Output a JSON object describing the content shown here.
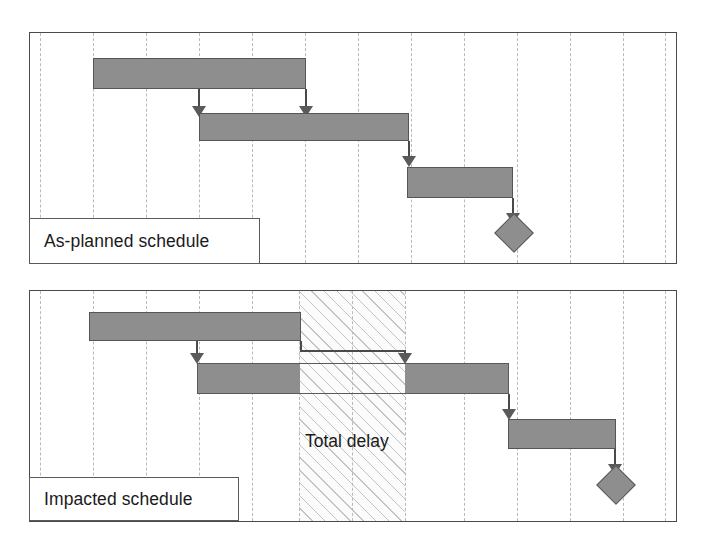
{
  "diagram": {
    "type": "gantt-delay-comparison",
    "colors": {
      "bar_fill": "#8e8e8e",
      "bar_border": "#555555",
      "gridline": "#b9b9b9",
      "frame": "#4a4a4a",
      "hatch": "#969696",
      "background": "#ffffff"
    }
  },
  "panels": [
    {
      "id": "as-planned",
      "legend_label": "As-planned schedule",
      "gridline_count": 13,
      "tasks": [
        {
          "name": "task-1",
          "start": 92,
          "end": 305,
          "row": 0
        },
        {
          "name": "task-2",
          "start": 198,
          "end": 408,
          "row": 1
        },
        {
          "name": "task-3",
          "start": 406,
          "end": 512,
          "row": 2
        }
      ],
      "milestone": {
        "name": "completion-milestone",
        "x": 512
      },
      "links": [
        {
          "from": "task-1",
          "to": "task-2",
          "at": 198
        },
        {
          "from": "task-1",
          "to": "task-2",
          "at": 305
        },
        {
          "from": "task-2",
          "to": "task-3",
          "at": 408
        },
        {
          "from": "task-3",
          "to": "milestone",
          "at": 512
        }
      ]
    },
    {
      "id": "impacted",
      "legend_label": "Impacted schedule",
      "delay_label": "Total delay",
      "gridline_count": 13,
      "delay_band": {
        "start": 298,
        "end": 404
      },
      "tasks": [
        {
          "name": "task-1",
          "start": 88,
          "end": 300,
          "row": 0
        },
        {
          "name": "task-2",
          "start": 196,
          "end": 508,
          "row": 1,
          "gap_start": 298,
          "gap_end": 403
        },
        {
          "name": "task-3",
          "start": 507,
          "end": 615,
          "row": 2
        }
      ],
      "milestone": {
        "name": "completion-milestone",
        "x": 613
      },
      "links": [
        {
          "from": "task-1",
          "to": "task-2",
          "at": 196
        },
        {
          "from": "task-1",
          "to": "task-2",
          "at": 403
        },
        {
          "from": "task-2",
          "to": "task-3",
          "at": 508
        },
        {
          "from": "task-3",
          "to": "milestone",
          "at": 613
        }
      ]
    }
  ]
}
